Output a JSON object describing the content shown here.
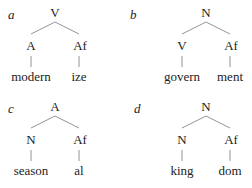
{
  "trees": [
    {
      "label": "a",
      "root": "V",
      "left": "A",
      "right": "Af",
      "left_word": "modern",
      "right_word": "ize"
    },
    {
      "label": "b",
      "root": "N",
      "left": "V",
      "right": "Af",
      "left_word": "govern",
      "right_word": "ment"
    },
    {
      "label": "c",
      "root": "A",
      "left": "N",
      "right": "Af",
      "left_word": "season",
      "right_word": "al"
    },
    {
      "label": "d",
      "root": "N",
      "left": "N",
      "right": "Af",
      "left_word": "king",
      "right_word": "dom"
    }
  ],
  "colors": {
    "line": "#777777",
    "text": "#222222"
  }
}
